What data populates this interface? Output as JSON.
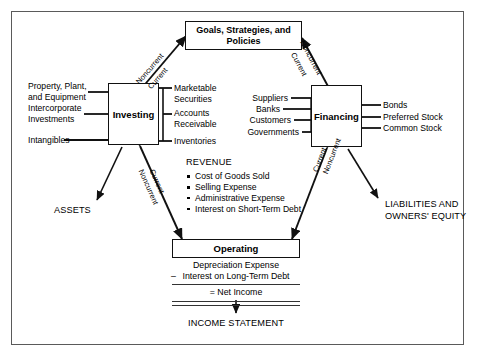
{
  "diagram": {
    "title_boxes": {
      "goals": "Goals, Strategies,\nand Policies",
      "investing": "Investing",
      "financing": "Financing",
      "operating": "Operating"
    },
    "investing_inputs": [
      "Property, Plant,\nand Equipment",
      "Intercorporate\nInvestments",
      "Intangibles"
    ],
    "investing_outputs": [
      "Marketable\nSecurities",
      "Accounts\nReceivable",
      "Inventories"
    ],
    "financing_inputs": [
      "Suppliers",
      "Banks",
      "Customers",
      "Governments"
    ],
    "financing_outputs": [
      "Bonds",
      "Preferred Stock",
      "Common Stock"
    ],
    "edge_labels": {
      "investing_goals_outer": "Noncurrent",
      "investing_goals_inner": "Current",
      "financing_goals_outer": "Noncurrent",
      "financing_goals_inner": "Current",
      "investing_operating_inner": "Current",
      "investing_operating_outer": "Noncurrent",
      "financing_operating_inner": "Current",
      "financing_operating_outer": "Noncurrent"
    },
    "revenue": {
      "heading": "REVENUE",
      "items": [
        "Cost of Goods Sold",
        "Selling Expense",
        "Administrative Expense",
        "Interest on Short-Term\nDebt"
      ]
    },
    "income_statement": {
      "line1": "Depreciation Expense",
      "line2_operator": "–",
      "line2": "Interest on Long-Term Debt",
      "line3_operator": "=",
      "line3": "Net Income",
      "footer": "INCOME STATEMENT"
    },
    "outcomes": {
      "assets": "ASSETS",
      "liabilities": "LIABILITIES AND\nOWNERS' EQUITY"
    }
  }
}
